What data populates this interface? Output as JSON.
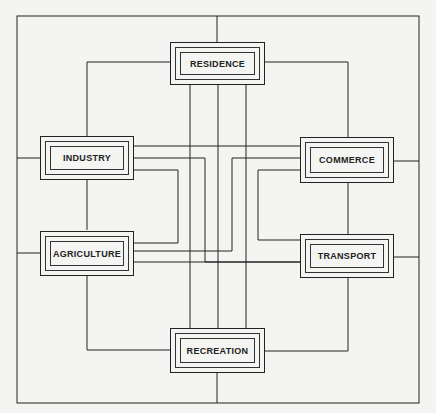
{
  "diagram": {
    "type": "interconnected land-use network",
    "nodes": [
      {
        "id": "residence",
        "label": "RESIDENCE"
      },
      {
        "id": "industry",
        "label": "INDUSTRY"
      },
      {
        "id": "commerce",
        "label": "COMMERCE"
      },
      {
        "id": "agriculture",
        "label": "AGRICULTURE"
      },
      {
        "id": "transport",
        "label": "TRANSPORT"
      },
      {
        "id": "recreation",
        "label": "RECREATION"
      }
    ],
    "edges": [
      [
        "residence",
        "industry"
      ],
      [
        "residence",
        "commerce"
      ],
      [
        "residence",
        "agriculture"
      ],
      [
        "residence",
        "transport"
      ],
      [
        "residence",
        "recreation"
      ],
      [
        "industry",
        "commerce"
      ],
      [
        "industry",
        "agriculture"
      ],
      [
        "industry",
        "transport"
      ],
      [
        "industry",
        "recreation"
      ],
      [
        "commerce",
        "agriculture"
      ],
      [
        "commerce",
        "transport"
      ],
      [
        "commerce",
        "recreation"
      ],
      [
        "agriculture",
        "transport"
      ],
      [
        "agriculture",
        "recreation"
      ],
      [
        "transport",
        "recreation"
      ]
    ],
    "line_color": "#222222",
    "background": "#f4f4f2"
  }
}
